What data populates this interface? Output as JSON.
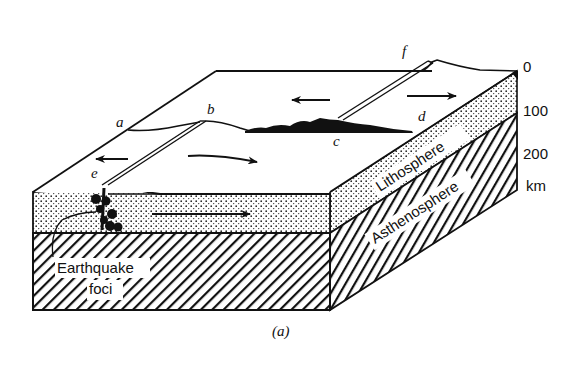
{
  "figure": {
    "caption": "(a)",
    "point_labels": {
      "a": "a",
      "b": "b",
      "c": "c",
      "d": "d",
      "e": "e",
      "f": "f"
    },
    "layers": {
      "lithosphere": "Lithosphere",
      "asthenosphere": "Asthenosphere"
    },
    "annotation": {
      "line1": "Earthquake",
      "line2": "foci"
    },
    "depth_scale": {
      "ticks": [
        "0",
        "100",
        "200"
      ],
      "unit": "km"
    },
    "colors": {
      "ink": "#111111",
      "paper": "#ffffff"
    }
  }
}
